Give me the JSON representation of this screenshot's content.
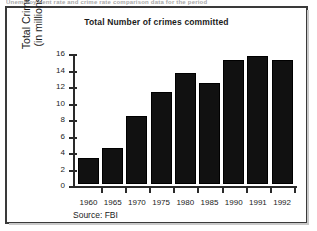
{
  "page": {
    "top_cutoff_text": "Unemployment rate and crime rate comparison data for the period"
  },
  "figure": {
    "source_note": "Source: FBI"
  },
  "chart_data": {
    "type": "bar",
    "title": "Total Number of crimes committed",
    "xlabel": "",
    "ylabel": "Total Crimes (in millions)",
    "ylabel_lines": [
      "Total Crimes",
      "(in millions)"
    ],
    "categories": [
      "1960",
      "1965",
      "1970",
      "1975",
      "1980",
      "1985",
      "1990",
      "1991",
      "1992"
    ],
    "values": [
      3.2,
      4.4,
      8.2,
      11.2,
      13.4,
      12.2,
      15.0,
      15.5,
      15.0
    ],
    "ylim": [
      0,
      16
    ],
    "yticks": [
      0,
      2,
      4,
      6,
      8,
      10,
      12,
      14,
      16
    ],
    "ytick_labels": [
      "0",
      "2",
      "4",
      "6",
      "8",
      "10",
      "12",
      "14",
      "16"
    ],
    "grid": false,
    "legend": null,
    "bar_color": "#111111",
    "axis_color": "#2a2a2a",
    "background": "#ffffff"
  }
}
